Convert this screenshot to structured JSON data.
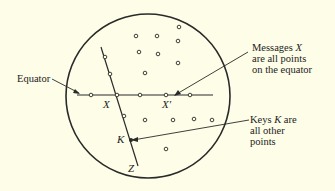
{
  "diagram": {
    "type": "sphere-cipher-illustration",
    "background": "#fdfde8",
    "stroke": "#2a2a2a",
    "labels": {
      "equator": "Equator",
      "messages_line1": "Messages ",
      "messages_var": "X",
      "messages_line2": "are all points",
      "messages_line3": "on the equator",
      "keys_line1_a": "Keys ",
      "keys_var": "K",
      "keys_line1_b": " are",
      "keys_line2": "all other",
      "keys_line3": "points"
    },
    "point_labels": {
      "x": "X",
      "x_prime": "X′",
      "k": "K",
      "z": "Z"
    }
  }
}
